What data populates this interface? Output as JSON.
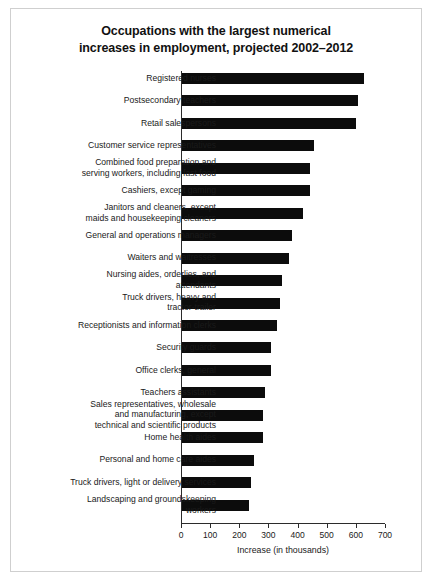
{
  "chart_data": {
    "type": "bar",
    "orientation": "horizontal",
    "title": "Occupations with the largest numerical increases in employment, projected 2002–2012",
    "title_lines": [
      "Occupations with the largest numerical",
      "increases in employment, projected 2002–2012"
    ],
    "xlabel": "Increase (in thousands)",
    "ylabel": "",
    "xlim": [
      0,
      700
    ],
    "xticks": [
      0,
      100,
      200,
      300,
      400,
      500,
      600,
      700
    ],
    "xtick_labels": [
      "0",
      "100",
      "200",
      "300",
      "400",
      "500",
      "600",
      "700"
    ],
    "grid": false,
    "legend": false,
    "bar_color": "#0c0c0c",
    "categories": [
      "Registered nurses",
      "Postsecondary teachers",
      "Retail salespersons",
      "Customer service representatives",
      "Combined food preparation and serving workers, including fast food",
      "Cashiers, except gaming",
      "Janitors and cleaners, except maids and housekeeping cleaners",
      "General and operations managers",
      "Waiters and waitresses",
      "Nursing aides, orderlies, and attendants",
      "Truck drivers, heavy and tractor-trailer",
      "Receptionists and information clerks",
      "Security guards",
      "Office clerks, general",
      "Teachers assistants",
      "Sales representatives, wholesale and manufacturing, except technical and scientific products",
      "Home health aides",
      "Personal and home care aides",
      "Truck drivers, light or delivery services",
      "Landscaping and groundskeeping workers"
    ],
    "category_lines": [
      [
        "Registered nurses"
      ],
      [
        "Postsecondary teachers"
      ],
      [
        "Retail salespersons"
      ],
      [
        "Customer service representatives"
      ],
      [
        "Combined food preparation and",
        "serving workers, including fast food"
      ],
      [
        "Cashiers, except gaming"
      ],
      [
        "Janitors and cleaners, except",
        "maids and housekeeping cleaners"
      ],
      [
        "General and operations managers"
      ],
      [
        "Waiters and waitresses"
      ],
      [
        "Nursing aides, orderlies, and",
        "attendants"
      ],
      [
        "Truck drivers, heavy and",
        "tractor-trailer"
      ],
      [
        "Receptionists and information clerks"
      ],
      [
        "Security guards"
      ],
      [
        "Office clerks, general"
      ],
      [
        "Teachers assistants"
      ],
      [
        "Sales representatives, wholesale",
        "and manufacturing, except",
        "technical and scientific products"
      ],
      [
        "Home health aides"
      ],
      [
        "Personal and home care aides"
      ],
      [
        "Truck drivers, light or delivery services"
      ],
      [
        "Landscaping and groundskeeping",
        "workers"
      ]
    ],
    "values": [
      623,
      603,
      596,
      454,
      440,
      440,
      414,
      376,
      367,
      343,
      337,
      325,
      307,
      305,
      286,
      279,
      279,
      246,
      237,
      230
    ]
  }
}
